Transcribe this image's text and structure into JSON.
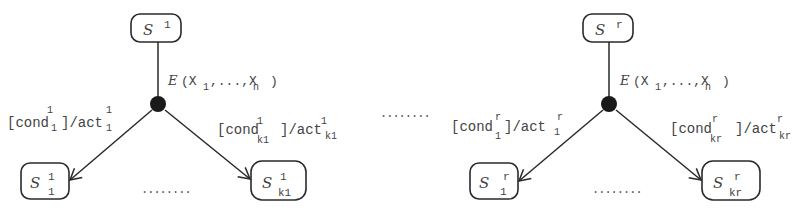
{
  "diagram": {
    "type": "state-transition-fragments",
    "separator_dots": "........",
    "groups": [
      {
        "id": "group-1",
        "source_state": {
          "name": "S",
          "sup": "1"
        },
        "event": {
          "name": "E",
          "args": "(X",
          "arg1_sub": "1",
          "mid": ",...,X",
          "argn_sub": "n",
          "close": ")"
        },
        "transitions": [
          {
            "cond": "[cond",
            "cond_sup": "1",
            "cond_sub": "1",
            "act": "]/act",
            "act_sup": "1",
            "act_sub": "1",
            "target": {
              "name": "S",
              "sup": "1",
              "sub": "1"
            }
          },
          {
            "cond": "[cond",
            "cond_sup": "1",
            "cond_sub": "k1",
            "act": "]/act",
            "act_sup": "1",
            "act_sub": "k1",
            "target": {
              "name": "S",
              "sup": "1",
              "sub": "k1"
            }
          }
        ],
        "between_targets": "........"
      },
      {
        "id": "group-r",
        "source_state": {
          "name": "S",
          "sup": "r"
        },
        "event": {
          "name": "E",
          "args": "(X",
          "arg1_sub": "1",
          "mid": ",...,X",
          "argn_sub": "n",
          "close": ")"
        },
        "transitions": [
          {
            "cond": "[cond",
            "cond_sup": "r",
            "cond_sub": "1",
            "act": "]/act",
            "act_sup": "r",
            "act_sub": "1",
            "target": {
              "name": "S",
              "sup": "r",
              "sub": "1"
            }
          },
          {
            "cond": "[cond",
            "cond_sup": "r",
            "cond_sub": "kr",
            "act": "]/act",
            "act_sup": "r",
            "act_sub": "kr",
            "target": {
              "name": "S",
              "sup": "r",
              "sub": "kr"
            }
          }
        ],
        "between_targets": "........"
      }
    ]
  }
}
